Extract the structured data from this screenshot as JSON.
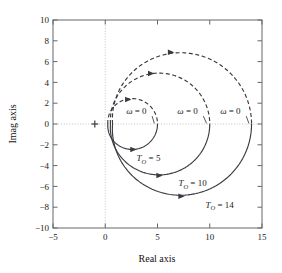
{
  "chart_data": {
    "type": "line",
    "title": "",
    "xlabel": "Real axis",
    "ylabel": "Imag axis",
    "xlim": [
      -5,
      15
    ],
    "ylim": [
      -10,
      10
    ],
    "xticks": [
      -5,
      0,
      5,
      10,
      15
    ],
    "yticks": [
      10,
      8,
      6,
      4,
      2,
      0,
      -2,
      -4,
      -6,
      -8,
      -10
    ],
    "xtick_labels": [
      "-5",
      "0",
      "5",
      "10",
      "15"
    ],
    "ytick_labels": [
      "10",
      "8",
      "6",
      "4",
      "2",
      "0",
      "-2",
      "-4",
      "-6",
      "-8",
      "-10"
    ],
    "grid": false,
    "zero_lines": {
      "x": 0,
      "y": 0,
      "style": "dotted"
    },
    "legend": "none",
    "marker_points": [
      {
        "name": "cross-marker",
        "x": -1,
        "y": 0,
        "symbol": "+"
      }
    ],
    "series": [
      {
        "name": "T_O = 5",
        "label": "T_O = 5",
        "label_text": "T",
        "label_sub": "O",
        "label_value": "= 5",
        "T_O": 5,
        "start": [
          0,
          0
        ],
        "end": [
          5,
          0
        ],
        "radius": 2.5,
        "center": [
          2.5,
          0
        ],
        "upper_half_style": "dashed",
        "lower_half_style": "solid",
        "direction": "clockwise",
        "peak_imag": 2.5,
        "trough_imag": -2.5,
        "omega_zero_point": [
          5,
          0
        ],
        "label_pos": [
          3.0,
          -3.6
        ],
        "arrow_upper": [
          2.2,
          2.35
        ],
        "arrow_lower": [
          2.7,
          -2.45
        ]
      },
      {
        "name": "T_O = 10",
        "label": "T_O = 10",
        "label_text": "T",
        "label_sub": "O",
        "label_value": "= 10",
        "T_O": 10,
        "start": [
          0,
          0
        ],
        "end": [
          10,
          0
        ],
        "radius": 5,
        "center": [
          5,
          0
        ],
        "upper_half_style": "dashed",
        "lower_half_style": "solid",
        "direction": "clockwise",
        "peak_imag": 5,
        "trough_imag": -5,
        "omega_zero_point": [
          10,
          0
        ],
        "label_pos": [
          7.0,
          -6.0
        ],
        "arrow_upper": [
          4.4,
          4.85
        ],
        "arrow_lower": [
          5.2,
          -4.95
        ]
      },
      {
        "name": "T_O = 14",
        "label": "T_O = 14",
        "label_text": "T",
        "label_sub": "O",
        "label_value": "= 14",
        "T_O": 14,
        "start": [
          0,
          0
        ],
        "end": [
          14,
          0
        ],
        "radius": 7,
        "center": [
          7,
          0
        ],
        "upper_half_style": "dashed",
        "lower_half_style": "solid",
        "direction": "clockwise",
        "peak_imag": 7,
        "trough_imag": -7,
        "omega_zero_point": [
          14,
          0
        ],
        "label_pos": [
          9.6,
          -8.1
        ],
        "arrow_upper": [
          6.3,
          6.9
        ],
        "arrow_lower": [
          7.3,
          -6.95
        ]
      }
    ],
    "annotations": [
      {
        "name": "omega-zero-label-small",
        "text": "ω = 0",
        "omega": "ω",
        "eq": "= 0",
        "x": 2.0,
        "y": 0.95,
        "leader_to": [
          4.7,
          0.05
        ]
      },
      {
        "name": "omega-zero-label-mid",
        "text": "ω = 0",
        "omega": "ω",
        "eq": "= 0",
        "x": 6.9,
        "y": 0.95,
        "leader_to": [
          9.7,
          0.05
        ]
      },
      {
        "name": "omega-zero-label-large",
        "text": "ω = 0",
        "omega": "ω",
        "eq": "= 0",
        "x": 11.0,
        "y": 0.95,
        "leader_to": [
          13.75,
          0.05
        ]
      }
    ],
    "colors": {
      "curve": "#3a3a42",
      "axis": "#555555",
      "frame": "#666666",
      "dotted_guide": "#bdbdbd",
      "text": "#1a1a1a",
      "background": "#ffffff"
    }
  }
}
